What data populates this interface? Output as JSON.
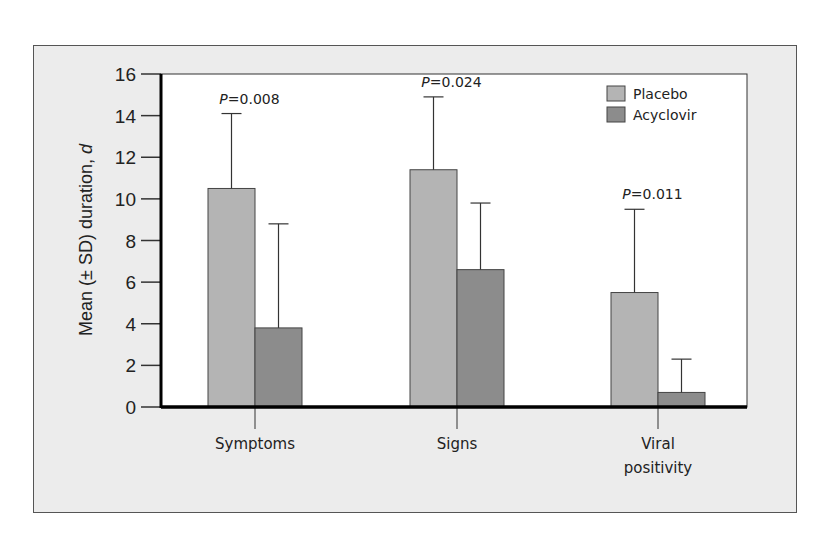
{
  "chart_data": {
    "type": "bar",
    "title": "",
    "xlabel": "",
    "ylabel": "Mean (± SD) duration, d",
    "ylim": [
      0,
      16
    ],
    "yticks": [
      0,
      2,
      4,
      6,
      8,
      10,
      12,
      14,
      16
    ],
    "grid": false,
    "legend_position": "top-right",
    "categories": [
      "Symptoms",
      "Signs",
      "Viral positivity"
    ],
    "series": [
      {
        "name": "Placebo",
        "color": "#b4b4b4",
        "values": [
          10.5,
          11.4,
          5.5
        ],
        "sd_upper": [
          14.1,
          14.9,
          9.5
        ]
      },
      {
        "name": "Acyclovir",
        "color": "#8c8c8c",
        "values": [
          3.8,
          6.6,
          0.7
        ],
        "sd_upper": [
          8.8,
          9.8,
          2.3
        ]
      }
    ],
    "annotations": [
      "P=0.008",
      "P=0.024",
      "P=0.011"
    ]
  },
  "labels": {
    "ylabel_main": "Mean (± SD) duration, ",
    "ylabel_italic": "d",
    "cat_lines": [
      [
        "Symptoms"
      ],
      [
        "Signs"
      ],
      [
        "Viral",
        "positivity"
      ]
    ],
    "p_values": [
      "=0.008",
      "=0.024",
      "=0.011"
    ],
    "p_letter": "P"
  }
}
